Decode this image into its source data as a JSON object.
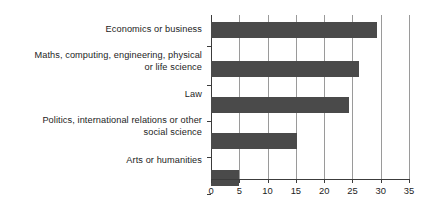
{
  "chart_data": {
    "type": "bar",
    "orientation": "horizontal",
    "title": "",
    "subtitle": "",
    "xlabel": "",
    "ylabel": "",
    "xlim": [
      0,
      35
    ],
    "grid": true,
    "legend": false,
    "categories": [
      "Economics or business",
      "Maths, computing, engineering, physical\nor life science",
      "Law",
      "Politics, international relations or other\nsocial science",
      "Arts or humanities"
    ],
    "values": [
      29.3,
      26.1,
      24.4,
      15.2,
      5.0
    ],
    "xticks": [
      "0",
      "5",
      "10",
      "15",
      "20",
      "25",
      "30",
      "35"
    ],
    "xtick_values": [
      0,
      5,
      10,
      15,
      20,
      25,
      30,
      35
    ],
    "bar_color": "#4a4a4a",
    "gridline_color": "#9a9a9a",
    "axis_color": "#3c3c3c",
    "background_color": "#ffffff"
  }
}
